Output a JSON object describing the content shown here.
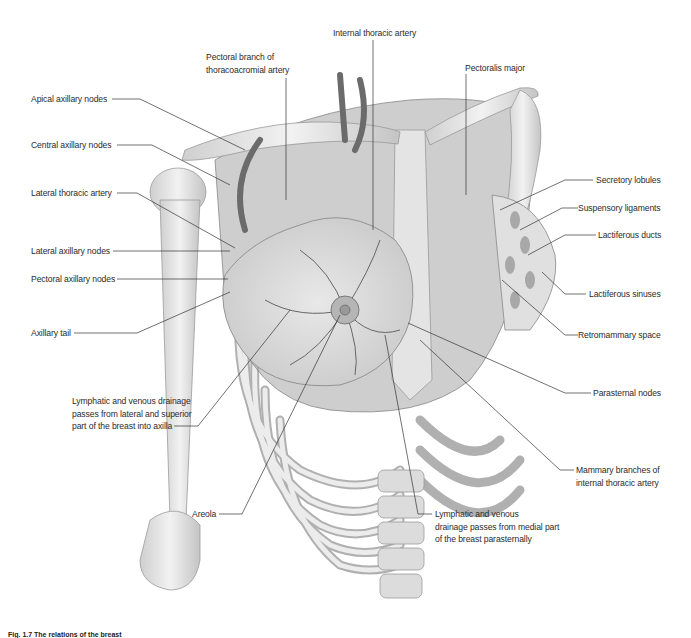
{
  "figure": {
    "type": "anatomical illustration",
    "palette": {
      "background": "#ffffff",
      "bone": "#e6e6e6",
      "bone_shadow": "#b9b9b9",
      "muscle": "#a9a9a9",
      "muscle_dark": "#8f8f8f",
      "gland": "#d9d9d9",
      "vessel": "#6f6f6f",
      "leader_line": "#333333",
      "text": "#2b2b2b"
    },
    "labels": {
      "internal_thoracic_artery": "Internal thoracic artery",
      "pectoral_branch": "Pectoral branch of\nthoracoacromial artery",
      "pectoralis_major": "Pectoralis major",
      "apical_axillary_nodes": "Apical axillary nodes",
      "central_axillary_nodes": "Central axillary nodes",
      "lateral_thoracic_artery": "Lateral thoracic artery",
      "lateral_axillary_nodes": "Lateral axillary nodes",
      "pectoral_axillary_nodes": "Pectoral axillary nodes",
      "axillary_tail": "Axillary tail",
      "lateral_drainage": "Lymphatic and venous drainage\npasses from lateral and superior\npart of the breast into axilla",
      "areola": "Areola",
      "medial_drainage": "Lymphatic and venous\ndrainage passes from medial part\nof the breast parasternally",
      "secretory_lobules": "Secretory lobules",
      "suspensory_ligaments": "Suspensory ligaments",
      "lactiferous_ducts": "Lactiferous ducts",
      "lactiferous_sinuses": "Lactiferous sinuses",
      "retromammary_space": "Retromammary space",
      "parasternal_nodes": "Parasternal nodes",
      "mammary_branches": "Mammary branches of\ninternal thoracic artery"
    },
    "caption": "Fig. 1.7 The relations of the breast"
  }
}
